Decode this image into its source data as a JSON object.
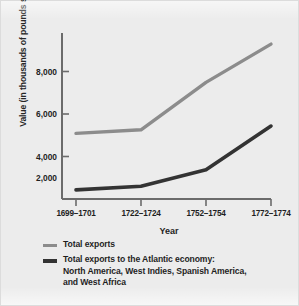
{
  "chart_data": {
    "type": "line",
    "title": "",
    "xlabel": "Year",
    "ylabel": "Value (in thousands of pounds sterling)",
    "categories": [
      "1699–1701",
      "1722–1724",
      "1752–1754",
      "1772–1774"
    ],
    "ylim": [
      0,
      9000
    ],
    "yticks": [
      2000,
      4000,
      6000,
      8000
    ],
    "ytick_labels": [
      "2,000",
      "4,000",
      "6,000",
      "8,000"
    ],
    "grid": false,
    "legend_position": "below-plot",
    "series": [
      {
        "name": "Total exports",
        "color": "#8c8c8c",
        "values": [
          3600,
          3800,
          6400,
          8500
        ]
      },
      {
        "name": "Total exports to the Atlantic economy: North America, West Indies, Spanish America, and West Africa",
        "color": "#333333",
        "values": [
          500,
          700,
          1600,
          4000
        ]
      }
    ]
  },
  "axes": {
    "y_title": "Value (in thousands of pounds sterling)",
    "x_title": "Year",
    "y_tick_labels": [
      "8,000",
      "6,000",
      "4,000",
      "2,000"
    ],
    "x_tick_labels": [
      "1699–1701",
      "1722–1724",
      "1752–1754",
      "1772–1774"
    ]
  },
  "legend": {
    "entries": [
      {
        "swatch_color": "#8c8c8c",
        "line1": "Total exports",
        "line2": "",
        "line3": ""
      },
      {
        "swatch_color": "#333333",
        "line1": "Total exports to the Atlantic economy:",
        "line2": "North America, West Indies, Spanish America,",
        "line3": "and West Africa"
      }
    ]
  },
  "colors": {
    "background": "#ececec",
    "axis": "#6b6b6b",
    "series_total_exports": "#8c8c8c",
    "series_atlantic": "#333333",
    "text": "#1f1f1f"
  }
}
